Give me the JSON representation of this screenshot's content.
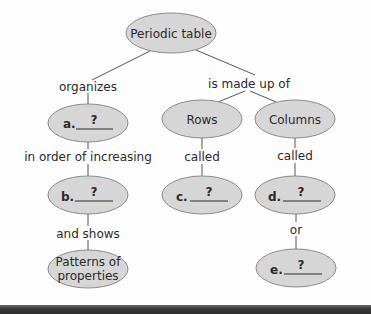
{
  "diagram": {
    "type": "concept-map",
    "colors": {
      "node_fill": "#d6d6d6",
      "node_stroke": "#8a8a8a",
      "line": "#555555",
      "text": "#2a2a2a"
    },
    "root": {
      "label": "Periodic table"
    },
    "links": {
      "organizes": "organizes",
      "made_up_of": "is made up of",
      "in_order_of": "in order of increasing",
      "rows_called": "called",
      "columns_called": "called",
      "and_shows": "and shows",
      "or": "or"
    },
    "nodes": {
      "a": {
        "letter": "a.",
        "answer": "?"
      },
      "b": {
        "letter": "b.",
        "answer": "?"
      },
      "c": {
        "letter": "c.",
        "answer": "?"
      },
      "d": {
        "letter": "d.",
        "answer": "?"
      },
      "e": {
        "letter": "e.",
        "answer": "?"
      },
      "rows": {
        "label": "Rows"
      },
      "columns": {
        "label": "Columns"
      },
      "patterns": {
        "line1": "Patterns of",
        "line2": "properties"
      }
    }
  }
}
